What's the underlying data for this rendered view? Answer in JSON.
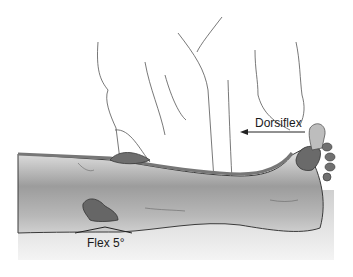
{
  "figure": {
    "labels": {
      "dorsiflex": "Dorsiflex",
      "flex": "Flex 5°"
    },
    "colors": {
      "skin_light": "#e6e6e6",
      "skin_shadow": "#9a9a9a",
      "hand_dark": "#6e6e6e",
      "outline": "#3a3a3a",
      "coat_line": "#555555",
      "table": "#d8d8d8"
    }
  }
}
